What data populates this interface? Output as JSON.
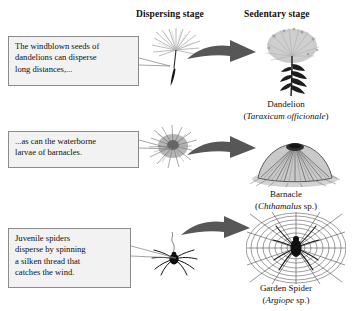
{
  "figure": {
    "background_color": "#ffffff",
    "headers": {
      "dispersing": "Dispersing stage",
      "sedentary": "Sedentary stage"
    },
    "arrow_color": "#575757",
    "callout_fill": "#f2f2f2",
    "callout_border": "#8c8c8c"
  },
  "callouts": {
    "dandelion": {
      "line1": "The windblown seeds of",
      "line2": "dandelions can disperse",
      "line3": "long distances,..."
    },
    "barnacle": {
      "line1": "...as can the waterborne",
      "line2": "larvae of barnacles."
    },
    "spider": {
      "line1": "Juvenile spiders",
      "line2": "disperse by spinning",
      "line3": "a silken thread that",
      "line4": "catches the wind."
    }
  },
  "organisms": [
    {
      "common_name": "Dandelion",
      "genus_species": "Taraxicum officionale",
      "rank_suffix": "",
      "dispersing_art": "dandelion-seed-illustration",
      "sedentary_art": "dandelion-plant-illustration"
    },
    {
      "common_name": "Barnacle",
      "genus_species": "Chthamalus",
      "rank_suffix": " sp.",
      "dispersing_art": "barnacle-larva-illustration",
      "sedentary_art": "barnacle-adult-illustration"
    },
    {
      "common_name": "Garden Spider",
      "genus_species": "Argiope",
      "rank_suffix": " sp.",
      "dispersing_art": "juvenile-spider-illustration",
      "sedentary_art": "spider-web-illustration"
    }
  ],
  "captions": {
    "dandelion": {
      "common": "Dandelion",
      "open_paren": "(",
      "sci": "Taraxicum officionale",
      "rank": "",
      "close_paren": ")"
    },
    "barnacle": {
      "common": "Barnacle",
      "open_paren": "(",
      "sci": "Chthamalus",
      "rank": " sp.",
      "close_paren": ")"
    },
    "spider": {
      "common": "Garden Spider",
      "open_paren": "(",
      "sci": "Argiope",
      "rank": " sp.",
      "close_paren": ")"
    }
  }
}
